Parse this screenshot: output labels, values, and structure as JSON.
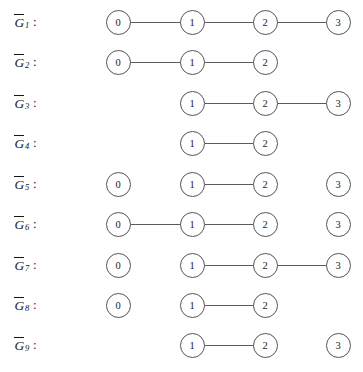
{
  "figure": {
    "caption": "",
    "width": 363,
    "height": 372,
    "node_labels": [
      "0",
      "1",
      "2",
      "3"
    ],
    "column_x": [
      118,
      192,
      265,
      338
    ],
    "node_radius": 12.5,
    "line_color": "#55555a",
    "text_color": "#1b1b1b",
    "background": "#ffffff"
  },
  "graphs": [
    {
      "label_base": "G",
      "label_sub": "1",
      "label_suffix": ":",
      "row_y": 22,
      "nodes": [
        "0",
        "1",
        "2",
        "3"
      ],
      "node_columns": [
        0,
        1,
        2,
        3
      ],
      "edges": [
        [
          0,
          1
        ],
        [
          1,
          2
        ],
        [
          2,
          3
        ]
      ]
    },
    {
      "label_base": "G",
      "label_sub": "2",
      "label_suffix": ":",
      "row_y": 62,
      "nodes": [
        "0",
        "1",
        "2"
      ],
      "node_columns": [
        0,
        1,
        2
      ],
      "edges": [
        [
          0,
          1
        ],
        [
          1,
          2
        ]
      ]
    },
    {
      "label_base": "G",
      "label_sub": "3",
      "label_suffix": ":",
      "row_y": 103,
      "nodes": [
        "1",
        "2",
        "3"
      ],
      "node_columns": [
        1,
        2,
        3
      ],
      "edges": [
        [
          1,
          2
        ],
        [
          2,
          3
        ]
      ]
    },
    {
      "label_base": "G",
      "label_sub": "4",
      "label_suffix": ":",
      "row_y": 143,
      "nodes": [
        "1",
        "2"
      ],
      "node_columns": [
        1,
        2
      ],
      "edges": [
        [
          1,
          2
        ]
      ]
    },
    {
      "label_base": "G",
      "label_sub": "5",
      "label_suffix": ":",
      "row_y": 184,
      "nodes": [
        "0",
        "1",
        "2",
        "3"
      ],
      "node_columns": [
        0,
        1,
        2,
        3
      ],
      "edges": [
        [
          1,
          2
        ]
      ]
    },
    {
      "label_base": "G",
      "label_sub": "6",
      "label_suffix": ":",
      "row_y": 224,
      "nodes": [
        "0",
        "1",
        "2",
        "3"
      ],
      "node_columns": [
        0,
        1,
        2,
        3
      ],
      "edges": [
        [
          0,
          1
        ],
        [
          1,
          2
        ]
      ]
    },
    {
      "label_base": "G",
      "label_sub": "7",
      "label_suffix": ":",
      "row_y": 265,
      "nodes": [
        "0",
        "1",
        "2",
        "3"
      ],
      "node_columns": [
        0,
        1,
        2,
        3
      ],
      "edges": [
        [
          1,
          2
        ],
        [
          2,
          3
        ]
      ]
    },
    {
      "label_base": "G",
      "label_sub": "8",
      "label_suffix": ":",
      "row_y": 305,
      "nodes": [
        "0",
        "1",
        "2"
      ],
      "node_columns": [
        0,
        1,
        2
      ],
      "edges": [
        [
          1,
          2
        ]
      ]
    },
    {
      "label_base": "G",
      "label_sub": "9",
      "label_suffix": ":",
      "row_y": 345,
      "nodes": [
        "1",
        "2",
        "3"
      ],
      "node_columns": [
        1,
        2,
        3
      ],
      "edges": [
        [
          1,
          2
        ]
      ]
    }
  ]
}
